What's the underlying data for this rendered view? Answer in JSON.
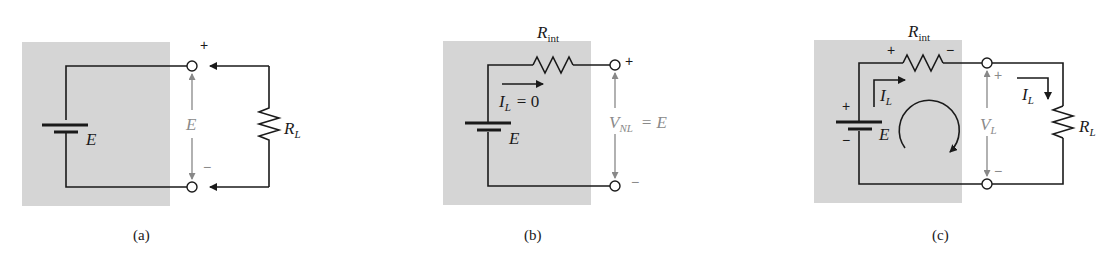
{
  "colors": {
    "shade": "#d5d5d5",
    "wire": "#1a1a1a",
    "annotation_gray": "#8a8a8a"
  },
  "panels": [
    {
      "id": "a",
      "caption": "(a)",
      "source_label": "E",
      "terminal_voltage_label": "E",
      "plus": "+",
      "minus": "−",
      "load": {
        "label": "R",
        "subscript": "L"
      }
    },
    {
      "id": "b",
      "caption": "(b)",
      "source_label": "E",
      "internal_resistor": {
        "label": "R",
        "subscript": "int"
      },
      "current": {
        "label": "I",
        "subscript": "L",
        "equation": "= 0"
      },
      "terminal_voltage": {
        "label": "V",
        "subscript": "NL",
        "equation": "= E"
      },
      "plus": "+",
      "minus": "−"
    },
    {
      "id": "c",
      "caption": "(c)",
      "source_label": "E",
      "source_plus": "+",
      "source_minus": "−",
      "internal_resistor": {
        "label": "R",
        "subscript": "int",
        "plus": "+",
        "minus": "−"
      },
      "current_internal": {
        "label": "I",
        "subscript": "L"
      },
      "current_load": {
        "label": "I",
        "subscript": "L"
      },
      "terminal_voltage": {
        "label": "V",
        "subscript": "L"
      },
      "plus": "+",
      "minus": "−",
      "load": {
        "label": "R",
        "subscript": "L"
      }
    }
  ]
}
